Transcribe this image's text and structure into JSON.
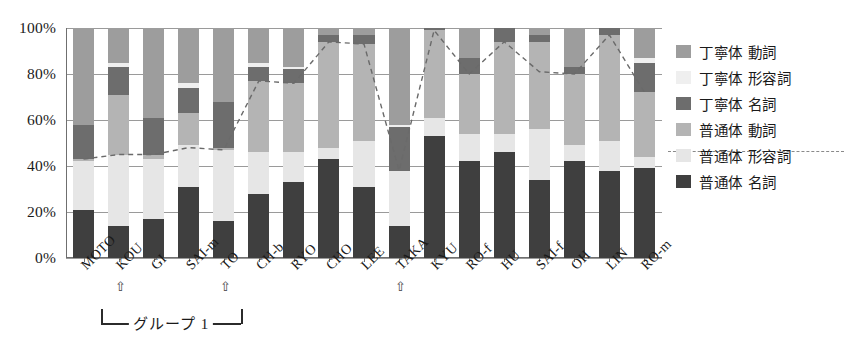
{
  "chart_data": {
    "type": "bar",
    "stacked": true,
    "title": "",
    "xlabel": "",
    "ylabel": "",
    "ylim": [
      0,
      100
    ],
    "ytick_labels": [
      "0%",
      "20%",
      "40%",
      "60%",
      "80%",
      "100%"
    ],
    "yticks": [
      0,
      20,
      40,
      60,
      80,
      100
    ],
    "grid": true,
    "legend_position": "right",
    "categories": [
      "MOTO",
      "KOU",
      "GI",
      "SAI-m",
      "TO",
      "CH-b",
      "RYO",
      "CHO",
      "LEE",
      "TAKA",
      "KYU",
      "RO-f",
      "HU",
      "SAI-f",
      "OH",
      "LIN",
      "RO-m"
    ],
    "series": [
      {
        "name": "普通体 名詞",
        "key": "plain_noun",
        "color": "#3f3f3f",
        "values": [
          21,
          14,
          17,
          31,
          16,
          28,
          33,
          43,
          31,
          14,
          53,
          42,
          46,
          34,
          42,
          38,
          39
        ]
      },
      {
        "name": "普通体 形容詞",
        "key": "plain_adj",
        "color": "#e6e6e6",
        "values": [
          21,
          31,
          26,
          18,
          31,
          18,
          13,
          5,
          20,
          24,
          8,
          12,
          8,
          22,
          7,
          13,
          5
        ]
      },
      {
        "name": "普通体 動詞",
        "key": "plain_verb",
        "color": "#b4b4b4",
        "values": [
          1,
          26,
          2,
          14,
          1,
          31,
          30,
          46,
          42,
          0,
          38,
          26,
          40,
          38,
          31,
          46,
          28
        ]
      },
      {
        "name": "丁寧体 名詞",
        "key": "polite_noun",
        "color": "#6d6d6d",
        "values": [
          15,
          12,
          16,
          11,
          20,
          6,
          6,
          3,
          4,
          19,
          1,
          7,
          6,
          3,
          3,
          3,
          13
        ]
      },
      {
        "name": "丁寧体 形容詞",
        "key": "polite_adj",
        "color": "#efefef",
        "values": [
          0,
          2,
          0,
          2,
          0,
          2,
          1,
          0,
          0,
          1,
          0,
          0,
          0,
          0,
          0,
          0,
          2
        ]
      },
      {
        "name": "丁寧体 動詞",
        "key": "polite_verb",
        "color": "#9d9d9d",
        "values": [
          42,
          15,
          39,
          24,
          32,
          15,
          17,
          3,
          3,
          42,
          0,
          13,
          0,
          3,
          17,
          0,
          13
        ]
      }
    ],
    "overlay_line": {
      "name": "普通体合計",
      "style": "dashed",
      "values": [
        43,
        45,
        45,
        48,
        47,
        77,
        76,
        94,
        93,
        38,
        99,
        80,
        94,
        81,
        80,
        97,
        72
      ]
    },
    "annotations": {
      "group_label": "グループ 1",
      "group_span": [
        "KOU",
        "TO"
      ],
      "arrow_glyph": "⇧",
      "arrow_categories": [
        "KOU",
        "TO",
        "TAKA"
      ]
    }
  },
  "legend": {
    "items": [
      {
        "label": "丁寧体 動詞",
        "color": "#9d9d9d"
      },
      {
        "label": "丁寧体 形容詞",
        "color": "#efefef"
      },
      {
        "label": "丁寧体 名詞",
        "color": "#6d6d6d"
      },
      {
        "label": "普通体 動詞",
        "color": "#b4b4b4"
      },
      {
        "label": "普通体 形容詞",
        "color": "#e6e6e6"
      },
      {
        "label": "普通体 名詞",
        "color": "#3f3f3f"
      }
    ]
  }
}
